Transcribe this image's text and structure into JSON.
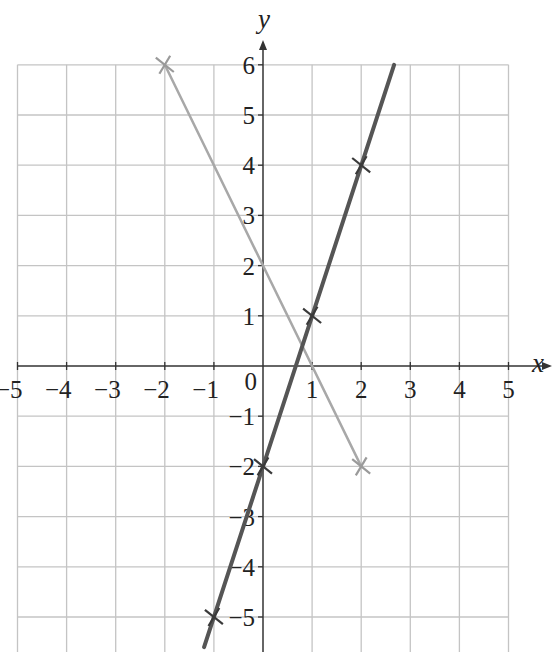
{
  "chart_data": {
    "type": "line",
    "title": "",
    "xlabel": "x",
    "ylabel": "y",
    "xlim": [
      -5,
      5
    ],
    "ylim": [
      -5.7,
      6
    ],
    "grid": true,
    "x_ticks": [
      -5,
      -4,
      -3,
      -2,
      -1,
      0,
      1,
      2,
      3,
      4,
      5
    ],
    "y_ticks": [
      -5,
      -4,
      -3,
      -2,
      -1,
      1,
      2,
      3,
      4,
      5,
      6
    ],
    "x_tick_labels": [
      "−5",
      "−4",
      "−3",
      "−2",
      "−1",
      "0",
      "1",
      "2",
      "3",
      "4",
      "5"
    ],
    "y_tick_labels": [
      "−5",
      "−4",
      "−3",
      "−2",
      "−1",
      "1",
      "2",
      "3",
      "4",
      "5",
      "6"
    ],
    "series": [
      {
        "name": "y = 3x − 2",
        "color": "#555555",
        "line_from": [
          -1.2,
          -5.6
        ],
        "line_to": [
          2.67,
          6
        ],
        "marked_points": [
          [
            -1,
            -5
          ],
          [
            0,
            -2
          ],
          [
            1,
            1
          ],
          [
            2,
            4
          ]
        ]
      },
      {
        "name": "y = −2x + 2",
        "color": "#a8a8a8",
        "line_from": [
          -2,
          6
        ],
        "line_to": [
          2,
          -2
        ],
        "marked_points": [
          [
            -2,
            6
          ],
          [
            2,
            -2
          ]
        ]
      }
    ]
  },
  "axes": {
    "x_name": "x",
    "y_name": "y",
    "origin_label": "0"
  }
}
